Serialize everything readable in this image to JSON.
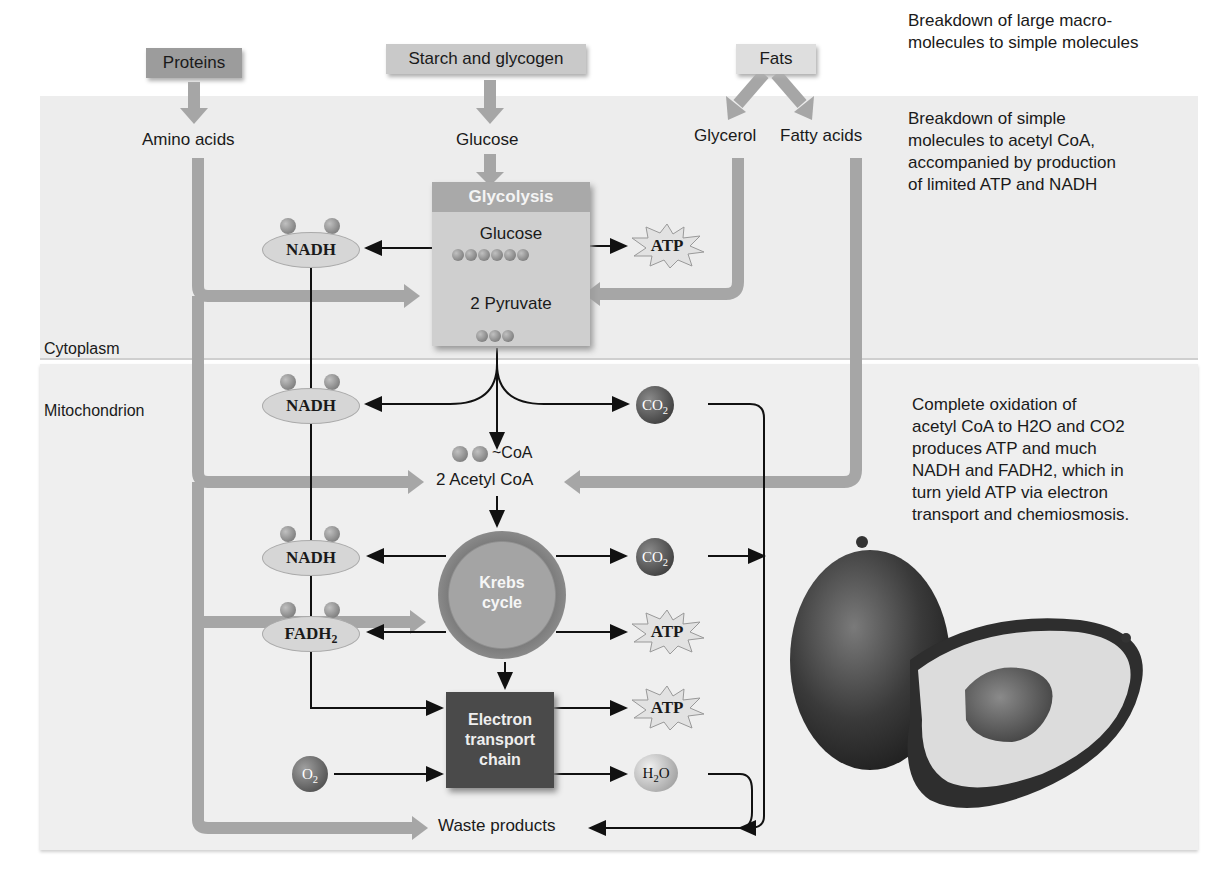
{
  "sources": {
    "proteins": "Proteins",
    "starch": "Starch and glycogen",
    "fats": "Fats"
  },
  "simple_molecules": {
    "amino_acids": "Amino acids",
    "glucose": "Glucose",
    "glycerol": "Glycerol",
    "fatty_acids": "Fatty acids"
  },
  "notes": {
    "stage1": [
      "Breakdown of large macro-",
      "molecules to simple molecules"
    ],
    "stage2": [
      "Breakdown of simple",
      "molecules to acetyl CoA,",
      "accompanied by production",
      "of limited ATP and NADH"
    ],
    "stage3": [
      "Complete oxidation of",
      "acetyl CoA to H2O and CO2",
      "produces ATP and much",
      "NADH and FADH2, which in",
      "turn yield ATP via electron",
      "transport and chemiosmosis."
    ]
  },
  "regions": {
    "cytoplasm": "Cytoplasm",
    "mitochondrion": "Mitochondrion"
  },
  "glycolysis": {
    "title": "Glycolysis",
    "input": "Glucose",
    "output": "2 Pyruvate"
  },
  "carriers": {
    "nadh_1": "NADH",
    "nadh_2": "NADH",
    "nadh_3": "NADH",
    "fadh2_sub": "2",
    "fadh2": "FADH"
  },
  "acetyl": {
    "coa_tag": "~CoA",
    "label": "2 Acetyl CoA"
  },
  "krebs": {
    "line1": "Krebs",
    "line2": "cycle"
  },
  "etc": {
    "line1": "Electron",
    "line2": "transport",
    "line3": "chain"
  },
  "products": {
    "atp": "ATP",
    "co2": "CO",
    "co2_sub": "2",
    "o2": "O",
    "o2_sub": "2",
    "h2o_h": "H",
    "h2o_sub": "2",
    "h2o_o": "O",
    "waste": "Waste products"
  },
  "colors": {
    "band_top": "#ededed",
    "band_bottom": "#efefef",
    "flow_arrow": "#a6a6a6",
    "glycolysis_header": "#a9a9a9",
    "etc_box": "#4a4a4a"
  }
}
